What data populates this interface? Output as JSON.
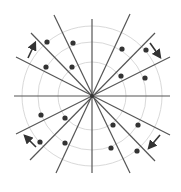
{
  "diagram": {
    "title": "",
    "center": {
      "x": 92,
      "y": 96
    },
    "colors": {
      "background": "#ffffff",
      "circle": "#d9d9d9",
      "line": "#555555",
      "dot": "#333333",
      "arrow": "#333333"
    },
    "circles": [
      {
        "r": 34
      },
      {
        "r": 54
      },
      {
        "r": 70
      }
    ],
    "lines": [
      {
        "x1": 92,
        "y1": 19,
        "x2": 92,
        "y2": 173
      },
      {
        "x1": 14,
        "y1": 96,
        "x2": 170,
        "y2": 96
      },
      {
        "x1": 54,
        "y1": 15,
        "x2": 130,
        "y2": 173
      },
      {
        "x1": 130,
        "y1": 14,
        "x2": 56,
        "y2": 173
      },
      {
        "x1": 31,
        "y1": 33,
        "x2": 155,
        "y2": 161
      },
      {
        "x1": 155,
        "y1": 33,
        "x2": 30,
        "y2": 160
      },
      {
        "x1": 16,
        "y1": 57,
        "x2": 170,
        "y2": 135
      },
      {
        "x1": 170,
        "y1": 57,
        "x2": 16,
        "y2": 134
      }
    ],
    "dots": [
      {
        "x": 47,
        "y": 42
      },
      {
        "x": 73,
        "y": 43
      },
      {
        "x": 46,
        "y": 67
      },
      {
        "x": 72,
        "y": 67
      },
      {
        "x": 122,
        "y": 49
      },
      {
        "x": 146,
        "y": 50
      },
      {
        "x": 121,
        "y": 76
      },
      {
        "x": 145,
        "y": 78
      },
      {
        "x": 41,
        "y": 115
      },
      {
        "x": 65,
        "y": 118
      },
      {
        "x": 40,
        "y": 142
      },
      {
        "x": 65,
        "y": 143
      },
      {
        "x": 113,
        "y": 125
      },
      {
        "x": 138,
        "y": 125
      },
      {
        "x": 111,
        "y": 148
      },
      {
        "x": 137,
        "y": 151
      }
    ],
    "arrows": [
      {
        "name": "arrow-upper-left",
        "x1": 28,
        "y1": 58,
        "x2": 35,
        "y2": 43
      },
      {
        "name": "arrow-upper-right",
        "x1": 150,
        "y1": 43,
        "x2": 160,
        "y2": 57
      },
      {
        "name": "arrow-lower-right",
        "x1": 160,
        "y1": 135,
        "x2": 149,
        "y2": 148
      },
      {
        "name": "arrow-lower-left",
        "x1": 36,
        "y1": 147,
        "x2": 25,
        "y2": 136
      }
    ]
  }
}
